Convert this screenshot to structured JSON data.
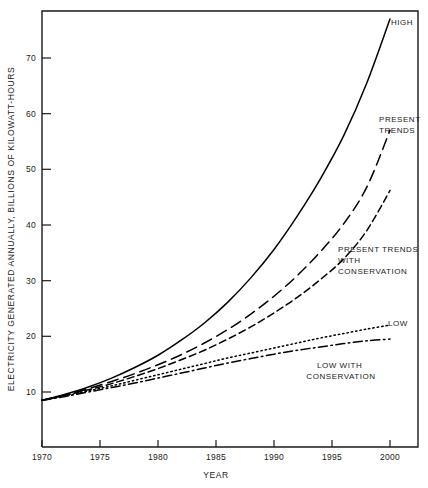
{
  "chart_data": {
    "type": "line",
    "title": "",
    "xlabel": "YEAR",
    "ylabel": "ELECTRICITY GENERATED ANNUALLY,  BILLIONS OF KILOWATT-HOURS",
    "xlim": [
      1970,
      2002
    ],
    "ylim": [
      4,
      79
    ],
    "grid": false,
    "legend_position": "inline-right-of-curve-ends",
    "xticks": [
      1970,
      1975,
      1980,
      1985,
      1990,
      1995,
      2000
    ],
    "xtick_labels": [
      "1970",
      "1975",
      "1980",
      "1985",
      "1990",
      "1995",
      "2000"
    ],
    "yticks": [
      10,
      20,
      30,
      40,
      50,
      60,
      70
    ],
    "ytick_labels": [
      "10",
      "20",
      "30",
      "40",
      "50",
      "60",
      "70"
    ],
    "x": [
      1970,
      1972,
      1974,
      1976,
      1978,
      1980,
      1982,
      1984,
      1986,
      1988,
      1990,
      1992,
      1994,
      1996,
      1998,
      2000
    ],
    "series": [
      {
        "name": "HIGH",
        "label": "HIGH",
        "style": "solid",
        "dash": "none",
        "color": "#000000",
        "values": [
          8.5,
          9.6,
          10.9,
          12.5,
          14.4,
          16.6,
          19.3,
          22.4,
          26.1,
          30.5,
          35.6,
          41.6,
          48.3,
          56.0,
          65.5,
          77.0
        ],
        "end_value": 77.0
      },
      {
        "name": "PRESENT TRENDS",
        "label": "PRESENT TRENDS",
        "style": "long-dash",
        "dash": "11 6",
        "color": "#000000",
        "values": [
          8.5,
          9.5,
          10.6,
          11.9,
          13.3,
          14.9,
          16.7,
          18.8,
          21.2,
          24.0,
          27.2,
          30.9,
          35.2,
          40.2,
          46.8,
          57.0
        ],
        "end_value": 57.0
      },
      {
        "name": "PRESENT TRENDS WITH CONSERVATION",
        "label": "PRESENT TRENDS WITH CONSERVATION",
        "style": "medium-dash",
        "dash": "7 4",
        "color": "#000000",
        "values": [
          8.5,
          9.4,
          10.4,
          11.5,
          12.8,
          14.2,
          15.8,
          17.5,
          19.5,
          21.7,
          24.2,
          27.0,
          30.2,
          33.9,
          39.0,
          46.2
        ],
        "end_value": 46.2
      },
      {
        "name": "LOW",
        "label": "LOW",
        "style": "dotted",
        "dash": "1.4 3",
        "color": "#000000",
        "values": [
          8.5,
          9.3,
          10.2,
          11.1,
          12.1,
          13.1,
          14.1,
          15.1,
          16.1,
          17.0,
          17.9,
          18.8,
          19.7,
          20.5,
          21.3,
          22.0
        ],
        "end_value": 22.0
      },
      {
        "name": "LOW WITH CONSERVATION",
        "label": "LOW WITH CONSERVATION",
        "style": "dash-dot",
        "dash": "9 3.5 1.6 3.5",
        "color": "#000000",
        "values": [
          8.5,
          9.2,
          10.0,
          10.8,
          11.6,
          12.5,
          13.4,
          14.3,
          15.2,
          16.0,
          16.8,
          17.5,
          18.1,
          18.7,
          19.2,
          19.5
        ],
        "end_value": 19.5
      }
    ],
    "annotations": [
      {
        "text": "HIGH",
        "lines": [
          "HIGH"
        ],
        "anchor": "start",
        "at_x": 2000,
        "at_y": 77.0
      },
      {
        "text": "PRESENT TRENDS",
        "lines": [
          "PRESENT",
          "TRENDS"
        ],
        "anchor": "start",
        "at_x": 1999,
        "at_y": 59.5
      },
      {
        "text": "PRESENT TRENDS WITH CONSERVATION",
        "lines": [
          "PRESENT TRENDS",
          "WITH",
          "CONSERVATION"
        ],
        "anchor": "start",
        "at_x": 1992,
        "at_y": 33.0
      },
      {
        "text": "LOW",
        "lines": [
          "LOW"
        ],
        "anchor": "start",
        "at_x": 2000,
        "at_y": 22.0
      },
      {
        "text": "LOW WITH CONSERVATION",
        "lines": [
          "LOW WITH",
          "CONSERVATION"
        ],
        "anchor": "middle",
        "at_x": 1996,
        "at_y": 16.5
      }
    ]
  }
}
